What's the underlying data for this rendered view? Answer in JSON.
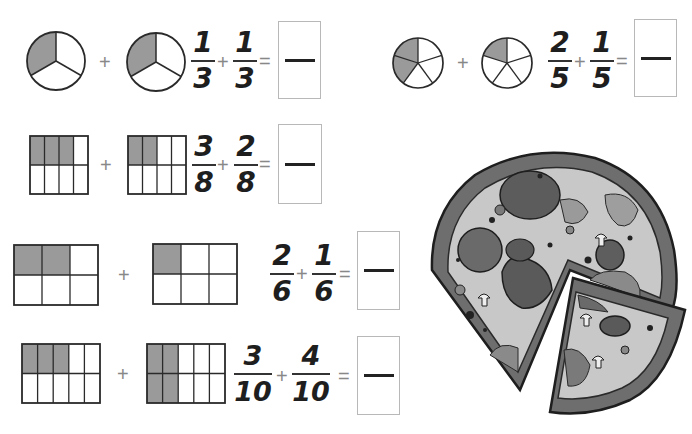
{
  "worksheet": {
    "problems": [
      {
        "id": "p1",
        "model": "circle",
        "parts": 3,
        "a": {
          "num": "1",
          "den": "3",
          "shaded": 1
        },
        "b": {
          "num": "1",
          "den": "3",
          "shaded": 1
        },
        "plus": "+",
        "equals": "=",
        "answer": ""
      },
      {
        "id": "p2",
        "model": "circle",
        "parts": 5,
        "a": {
          "num": "2",
          "den": "5",
          "shaded": 2
        },
        "b": {
          "num": "1",
          "den": "5",
          "shaded": 1
        },
        "plus": "+",
        "equals": "=",
        "answer": ""
      },
      {
        "id": "p3",
        "model": "grid",
        "rows": 2,
        "cols": 4,
        "a": {
          "num": "3",
          "den": "8",
          "shaded": 3
        },
        "b": {
          "num": "2",
          "den": "8",
          "shaded": 2
        },
        "plus": "+",
        "equals": "=",
        "answer": ""
      },
      {
        "id": "p4",
        "model": "grid",
        "rows": 2,
        "cols": 3,
        "a": {
          "num": "2",
          "den": "6",
          "shaded": 2
        },
        "b": {
          "num": "1",
          "den": "6",
          "shaded": 1
        },
        "plus": "+",
        "equals": "=",
        "answer": ""
      },
      {
        "id": "p5",
        "model": "grid",
        "rows": 2,
        "cols": 5,
        "a": {
          "num": "3",
          "den": "10",
          "shaded": 3
        },
        "b": {
          "num": "4",
          "den": "10",
          "shaded": 4
        },
        "plus": "+",
        "equals": "=",
        "answer": ""
      }
    ],
    "illustration": "pizza-with-slice-removed"
  },
  "colors": {
    "shade": "#9a9a9a",
    "outline": "#2a2a2a",
    "box_border": "#b8b8b8"
  }
}
